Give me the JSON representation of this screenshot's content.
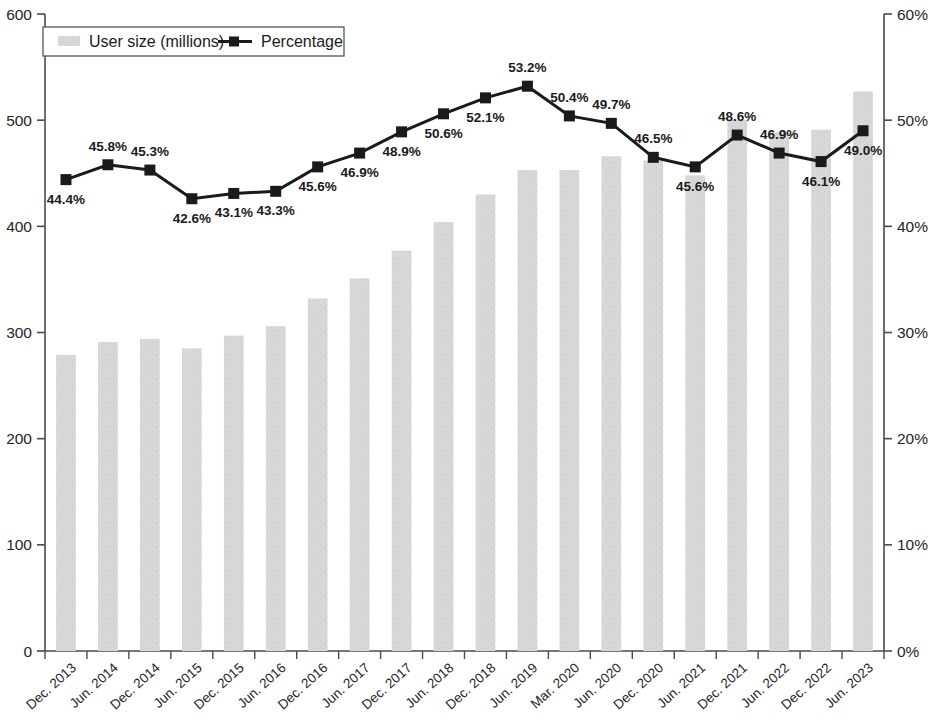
{
  "chart_data": {
    "type": "bar",
    "title": "",
    "subtitle": "",
    "xlabel": "",
    "ylabel": "",
    "y2label": "",
    "grid": false,
    "legend_position": "top-left",
    "categories": [
      "Dec. 2013",
      "Jun. 2014",
      "Dec. 2014",
      "Jun. 2015",
      "Dec. 2015",
      "Jun. 2016",
      "Dec. 2016",
      "Jun. 2017",
      "Dec. 2017",
      "Jun. 2018",
      "Dec. 2018",
      "Jun. 2019",
      "Mar. 2020",
      "Jun. 2020",
      "Dec. 2020",
      "Jun. 2021",
      "Dec. 2021",
      "Jun. 2022",
      "Dec. 2022",
      "Jun. 2023"
    ],
    "series": [
      {
        "name": "User size (millions)",
        "axis": "left",
        "type": "bar",
        "color": "#d6d6d6",
        "values": [
          279,
          291,
          294,
          285,
          297,
          306,
          332,
          351,
          377,
          404,
          430,
          453,
          453,
          466,
          462,
          448,
          500,
          489,
          491,
          527
        ]
      },
      {
        "name": "Percentage",
        "axis": "right",
        "type": "line",
        "color": "#1a1a1a",
        "values": [
          44.4,
          45.8,
          45.3,
          42.6,
          43.1,
          43.3,
          45.6,
          46.9,
          48.9,
          50.6,
          52.1,
          53.2,
          50.4,
          49.7,
          46.5,
          45.6,
          48.6,
          46.9,
          46.1,
          49.0
        ],
        "labels": [
          "44.4%",
          "45.8%",
          "45.3%",
          "42.6%",
          "43.1%",
          "43.3%",
          "45.6%",
          "46.9%",
          "48.9%",
          "50.6%",
          "52.1%",
          "53.2%",
          "50.4%",
          "49.7%",
          "46.5%",
          "45.6%",
          "48.6%",
          "46.9%",
          "46.1%",
          "49.0%"
        ],
        "label_positions": [
          "below",
          "above",
          "above",
          "below",
          "below",
          "below",
          "below",
          "below",
          "below",
          "below",
          "below",
          "above",
          "above",
          "above",
          "above",
          "below",
          "above",
          "above",
          "below",
          "below"
        ]
      }
    ],
    "left_axis": {
      "min": 0,
      "max": 600,
      "step": 100,
      "ticks": [
        "0",
        "100",
        "200",
        "300",
        "400",
        "500",
        "600"
      ]
    },
    "right_axis": {
      "min": 0,
      "max": 60,
      "step": 10,
      "ticks": [
        "0%",
        "10%",
        "20%",
        "30%",
        "40%",
        "50%",
        "60%"
      ]
    }
  },
  "legend": {
    "bar_label": "User size (millions)",
    "line_label": "Percentage"
  }
}
